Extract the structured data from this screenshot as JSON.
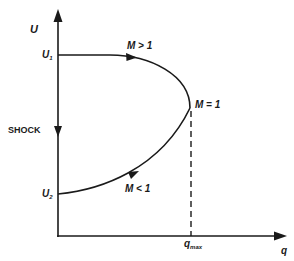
{
  "diagram": {
    "axes": {
      "y_label": "U",
      "x_label": "q",
      "x_tick_main": "q",
      "x_tick_sub": "max"
    },
    "levels": {
      "u1_main": "U",
      "u1_sub": "1",
      "u2_main": "U",
      "u2_sub": "2"
    },
    "annotations": {
      "shock": "SHOCK",
      "supersonic": "M > 1",
      "sonic": "M = 1",
      "subsonic": "M < 1"
    },
    "colors": {
      "line": "#1a1a1a",
      "background": "#ffffff"
    }
  }
}
